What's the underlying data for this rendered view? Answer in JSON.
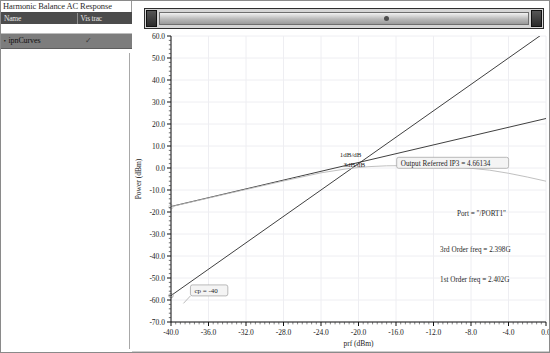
{
  "window": {
    "title": "Harmonic Balance AC Response"
  },
  "curve_table": {
    "headers": [
      "Name",
      "Vis trac"
    ],
    "rows": [
      {
        "bullet": "•",
        "name": "ipnCurves",
        "vis": "✓"
      }
    ]
  },
  "scrollbar": {
    "left_arrow": "◀",
    "right_arrow": "▶"
  },
  "chart_data": {
    "type": "line",
    "title": "Harmonic Balance AC Response",
    "xlabel": "prf (dBm)",
    "ylabel": "Power (dBm)",
    "xlim": [
      -40.0,
      0.0
    ],
    "ylim": [
      -70.0,
      60.0
    ],
    "xticks": [
      "-40.0",
      "-36.0",
      "-32.0",
      "-28.0",
      "-24.0",
      "-20.0",
      "-16.0",
      "-12.0",
      "-8.0",
      "-4.0",
      "0.0"
    ],
    "yticks": [
      "60.0",
      "50.0",
      "40.0",
      "30.0",
      "20.0",
      "10.0",
      "0.0",
      "-10.0",
      "-20.0",
      "-30.0",
      "-40.0",
      "-50.0",
      "-60.0",
      "-70.0"
    ],
    "grid": true,
    "legend": "none",
    "series": [
      {
        "name": "1dB/dB extrapolation",
        "slope_label": "1dB/dB",
        "color": "#2a2a2a",
        "points": [
          [
            -40.0,
            -17.5
          ],
          [
            0.0,
            22.5
          ]
        ]
      },
      {
        "name": "3dB/dB extrapolation",
        "slope_label": "3dB/dB",
        "color": "#2a2a2a",
        "points": [
          [
            -40.0,
            -58.0
          ],
          [
            0.0,
            62.0
          ]
        ]
      },
      {
        "name": "fundamental output (measured)",
        "color": "#b9b9b9",
        "points": [
          [
            -40.0,
            -17.6
          ],
          [
            -34.0,
            -11.7
          ],
          [
            -28.0,
            -5.9
          ],
          [
            -24.0,
            -2.2
          ],
          [
            -21.0,
            -0.2
          ],
          [
            -19.0,
            0.6
          ],
          [
            -17.0,
            1.0
          ],
          [
            -15.0,
            1.1
          ],
          [
            -12.0,
            0.9
          ],
          [
            -9.0,
            0.3
          ],
          [
            -6.0,
            -1.0
          ],
          [
            -4.0,
            -2.4
          ],
          [
            -2.0,
            -4.1
          ],
          [
            0.0,
            -6.0
          ]
        ]
      }
    ],
    "annotations": [
      {
        "id": "slope-1db",
        "text": "1dB/dB",
        "x": -22.0,
        "y": 5.0
      },
      {
        "id": "slope-3db",
        "text": "3dB/dB",
        "x": -21.6,
        "y": 0.5
      },
      {
        "id": "ip3-box",
        "text": "Output Referred IP3 = 4.66134",
        "x": -15.5,
        "y": 1.0
      },
      {
        "id": "port",
        "text": "Port = \"/PORT1\"",
        "x": -9.5,
        "y": -22.0
      },
      {
        "id": "third-freq",
        "text": "3rd Order freq = 2.398G",
        "x": -11.3,
        "y": -38.0
      },
      {
        "id": "first-freq",
        "text": "1st Order freq = 2.402G",
        "x": -11.3,
        "y": -52.0
      },
      {
        "id": "cp-marker",
        "text": "cp = -40",
        "x": -37.5,
        "y": -57.0
      }
    ]
  }
}
